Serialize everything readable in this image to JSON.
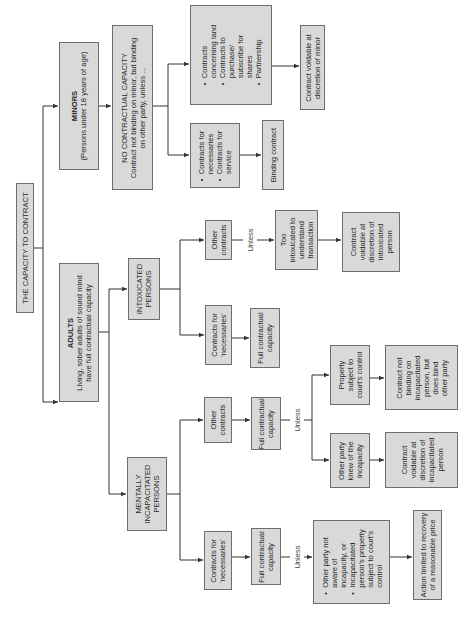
{
  "diagram": {
    "title": "THE CAPACITY TO CONTRACT",
    "colors": {
      "box_fill": "#d9d9d9",
      "box_border": "#6e6e6e",
      "line": "#333333"
    },
    "orientation": "rotated 90deg counter-clockwise",
    "minors": {
      "heading": "MINORS",
      "sub": "(Persons under 18 years of age)",
      "no_capacity": {
        "line1": "NO CONTRACTUAL CAPACITY",
        "line2": "Contract not binding on minor, but binding",
        "line3": "on other party, unless ..."
      },
      "necessaries": {
        "items": [
          "Contracts for",
          "necessaries",
          "Contracts for",
          "service"
        ]
      },
      "binding": "Binding contract",
      "land": {
        "items": [
          "Contracts",
          "concerning land",
          "Contracts to",
          "purchase/",
          "subscribe for",
          "shares",
          "Partnership"
        ]
      },
      "voidable": {
        "line1": "Contract voidable at",
        "line2": "discretion of minor"
      }
    },
    "adults": {
      "heading": "ADULTS",
      "line1": "Living, sober adults of sound mind",
      "line2": "have full contractual capacity",
      "intoxicated": {
        "heading_line1": "INTOXICATED",
        "heading_line2": "PERSONS",
        "other": {
          "line1": "Other",
          "line2": "contracts"
        },
        "necessaries": {
          "line1": "Contracts for",
          "line2": "'necessaries'"
        },
        "full": {
          "line1": "Full contractual",
          "line2": "capacity"
        },
        "unless": "Unless",
        "too": {
          "line1": "Too",
          "line2": "intoxicated to",
          "line3": "understand",
          "line4": "transaction"
        },
        "voidable": {
          "line1": "Contract",
          "line2": "voidable at",
          "line3": "discretion of",
          "line4": "intoxicated",
          "line5": "person"
        }
      },
      "mental": {
        "heading_line1": "MENTALLY",
        "heading_line2": "INCAPACITATED",
        "heading_line3": "PERSONS",
        "other": {
          "line1": "Other",
          "line2": "contracts"
        },
        "necessaries": {
          "line1": "Contracts for",
          "line2": "'necessaries'"
        },
        "full_other": {
          "line1": "Full contractual",
          "line2": "capacity"
        },
        "full_nec": {
          "line1": "Full contractual",
          "line2": "capacity"
        },
        "unless_other": "Unless",
        "unless_nec": "Unless",
        "property": {
          "line1": "Property",
          "line2": "subject to",
          "line3": "court's control"
        },
        "not_binding": {
          "line1": "Contract not",
          "line2": "binding on",
          "line3": "incapacitated",
          "line4": "person, but",
          "line5": "does bind",
          "line6": "other party"
        },
        "knew": {
          "line1": "Other party",
          "line2": "knew of the",
          "line3": "incapacity"
        },
        "voidable": {
          "line1": "Contract",
          "line2": "voidable at",
          "line3": "discretion of",
          "line4": "incapacitated",
          "line5": "person"
        },
        "not_aware": {
          "items": [
            "Other party not",
            "aware of",
            "incapacity, or",
            "Incapacitated",
            "person's property",
            "subject to court's",
            "control"
          ]
        },
        "action": {
          "line1": "Action limited to recovery",
          "line2": "of a reasonable price"
        }
      }
    }
  }
}
